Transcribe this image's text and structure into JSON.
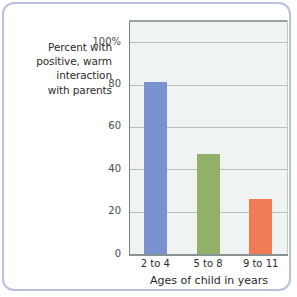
{
  "figure": {
    "frame_color": "#b9c0dd",
    "background": "#ffffff",
    "plot_background": "#eff3f1"
  },
  "y_axis_caption": {
    "lines": [
      "Percent with",
      "positive, warm",
      "interaction",
      "with parents"
    ]
  },
  "chart_data": {
    "type": "bar",
    "title": "",
    "subtitle": "",
    "xlabel": "Ages of child in years",
    "ylabel": "Percent with positive, warm interaction with parents",
    "categories": [
      "2 to 4",
      "5 to 8",
      "9 to 11"
    ],
    "values": [
      81,
      47,
      26
    ],
    "ylim": [
      0,
      110
    ],
    "yticks": [
      0,
      20,
      40,
      60,
      80,
      100
    ],
    "ytick_labels": [
      "0",
      "20",
      "40",
      "60",
      "80",
      "100%"
    ],
    "grid": true,
    "grid_axis": "y",
    "legend": false,
    "legend_position": "none",
    "bar_colors": [
      "#7a92cf",
      "#93b069",
      "#ef7c54"
    ],
    "series": [
      {
        "name": "Percent with positive, warm interaction with parents",
        "values": [
          81,
          47,
          26
        ]
      }
    ]
  }
}
